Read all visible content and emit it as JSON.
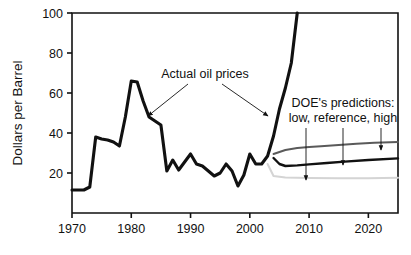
{
  "chart_data": {
    "type": "line",
    "title": "",
    "subtitle": "",
    "xlabel": "",
    "ylabel": "Dollars per Barrel",
    "xlim": [
      1970,
      2025
    ],
    "ylim": [
      0,
      100
    ],
    "grid": false,
    "legend_position": "none",
    "xticks": [
      1970,
      1980,
      1990,
      2000,
      2010,
      2020
    ],
    "xtick_labels": [
      "1970",
      "1980",
      "1990",
      "2000",
      "2010",
      "2020"
    ],
    "yticks": [
      20,
      40,
      60,
      80,
      100
    ],
    "ytick_labels": [
      "20",
      "40",
      "60",
      "80",
      "100"
    ],
    "series": [
      {
        "name": "Actual oil prices",
        "color": "#111111",
        "width": 3.1,
        "x": [
          1970,
          1971,
          1972,
          1973,
          1974,
          1975,
          1976,
          1977,
          1978,
          1979,
          1980,
          1981,
          1982,
          1983,
          1984,
          1985,
          1986,
          1987,
          1988,
          1989,
          1990,
          1991,
          1992,
          1993,
          1994,
          1995,
          1996,
          1997,
          1998,
          1999,
          2000,
          2001,
          2002,
          2003,
          2004,
          2005,
          2006,
          2007,
          2008
        ],
        "values": [
          11.5,
          11.5,
          11.5,
          13.0,
          38.0,
          37.0,
          36.5,
          35.5,
          33.5,
          48.0,
          66.0,
          65.5,
          56.0,
          48.0,
          46.0,
          44.0,
          21.0,
          26.5,
          21.5,
          25.5,
          29.5,
          24.5,
          23.5,
          21.0,
          18.5,
          20.0,
          24.5,
          21.0,
          13.5,
          19.0,
          29.5,
          24.5,
          24.5,
          28.5,
          38.5,
          52.0,
          62.5,
          75.0,
          100.0
        ]
      },
      {
        "name": "DOE prediction - high",
        "color": "#5a5a5a",
        "width": 2.0,
        "x": [
          2004,
          2006,
          2008,
          2010,
          2012,
          2015,
          2018,
          2021,
          2025
        ],
        "values": [
          29.5,
          31.5,
          32.5,
          33.0,
          33.4,
          34.0,
          34.6,
          35.1,
          35.5
        ]
      },
      {
        "name": "DOE prediction - reference",
        "color": "#111111",
        "width": 2.4,
        "x": [
          2004,
          2005,
          2006,
          2008,
          2010,
          2013,
          2016,
          2020,
          2025
        ],
        "values": [
          27.5,
          24.5,
          23.5,
          23.8,
          24.3,
          25.0,
          25.7,
          26.5,
          27.3
        ]
      },
      {
        "name": "DOE prediction - low",
        "color": "#d4d4d4",
        "width": 2.0,
        "x": [
          2003,
          2004,
          2006,
          2010,
          2015,
          2020,
          2025
        ],
        "values": [
          24.5,
          18.5,
          17.8,
          17.5,
          17.4,
          17.4,
          17.6
        ]
      }
    ],
    "annotations": [
      {
        "id": "actual-oil-prices",
        "text": "Actual oil prices",
        "text_x": 205,
        "text_y": 78,
        "arrows": [
          {
            "id": "arrow-to-1983",
            "from_x": 188,
            "from_y": 84,
            "to_x": 148,
            "to_y": 116
          },
          {
            "id": "arrow-to-2003",
            "from_x": 222,
            "from_y": 84,
            "to_x": 268,
            "to_y": 116
          }
        ]
      },
      {
        "id": "doe-predictions",
        "line1": "DOE's predictions:",
        "line2": "low, reference, high",
        "text_x": 343,
        "text_y": 107,
        "arrows": [
          {
            "id": "arrow-to-low",
            "from_x": 306,
            "from_y": 128,
            "to_x": 306,
            "to_y": 180
          },
          {
            "id": "arrow-to-reference",
            "from_x": 343,
            "from_y": 128,
            "to_x": 343,
            "to_y": 165
          },
          {
            "id": "arrow-to-high",
            "from_x": 381,
            "from_y": 128,
            "to_x": 381,
            "to_y": 150
          }
        ]
      }
    ]
  },
  "figure": {
    "plot_left": 72,
    "plot_right": 398,
    "plot_top": 13,
    "plot_bottom": 213,
    "background": "#ffffff",
    "axis_color": "#111111"
  }
}
